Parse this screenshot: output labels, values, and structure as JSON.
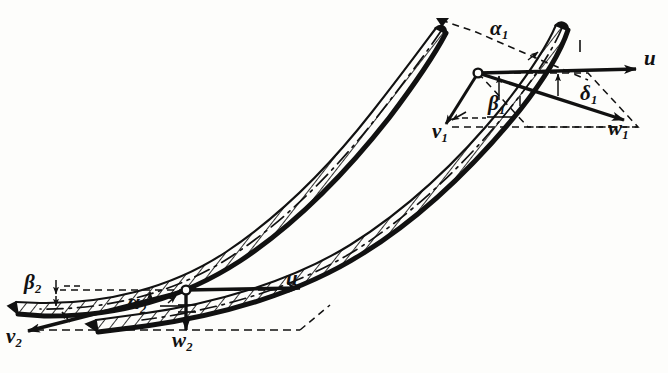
{
  "figure": {
    "background_color": "#fdfdfb",
    "ink_color": "#111111",
    "hatch_color": "#1a1a1a"
  },
  "inlet_triangle": {
    "name": "inlet-velocity-triangle",
    "hub_label": "pivot-point-1",
    "vectors": [
      {
        "id": "u1",
        "symbol": "u",
        "subscript": "",
        "direction": "right-horizontal",
        "label_x": 648,
        "label_y": 58
      },
      {
        "id": "w1",
        "symbol": "w",
        "subscript": "1",
        "direction": "down-right",
        "label_x": 616,
        "label_y": 127
      },
      {
        "id": "v1",
        "symbol": "v",
        "subscript": "1",
        "direction": "down-left",
        "label_x": 436,
        "label_y": 130
      }
    ],
    "angles": [
      {
        "id": "alpha1",
        "symbol": "α",
        "subscript": "1",
        "label_x": 496,
        "label_y": 27
      },
      {
        "id": "beta1",
        "symbol": "β",
        "subscript": "1",
        "label_x": 492,
        "label_y": 103
      },
      {
        "id": "delta1",
        "symbol": "δ",
        "subscript": "1",
        "label_x": 585,
        "label_y": 92
      }
    ]
  },
  "outlet_triangle": {
    "name": "outlet-velocity-triangle",
    "hub_label": "pivot-point-2",
    "vectors": [
      {
        "id": "u2",
        "symbol": "u",
        "subscript": "",
        "direction": "right-horizontal",
        "label_x": 289,
        "label_y": 278
      },
      {
        "id": "w2",
        "symbol": "w",
        "subscript": "2",
        "direction": "down-vertical",
        "label_x": 179,
        "label_y": 339
      },
      {
        "id": "v2",
        "symbol": "v",
        "subscript": "2",
        "direction": "down-left",
        "label_x": 8,
        "label_y": 334
      }
    ],
    "angles": [
      {
        "id": "alpha2",
        "symbol": "α",
        "subscript": "2",
        "label_x": 135,
        "label_y": 301
      },
      {
        "id": "beta2",
        "symbol": "β",
        "subscript": "2",
        "label_x": 29,
        "label_y": 281
      }
    ]
  },
  "blades": [
    {
      "id": "blade-upper",
      "style": "hatched-curved-profile"
    },
    {
      "id": "blade-lower",
      "style": "hatched-curved-profile"
    }
  ],
  "construction_lines": {
    "style": "dashed",
    "camber_line_style": "dash-dot"
  }
}
